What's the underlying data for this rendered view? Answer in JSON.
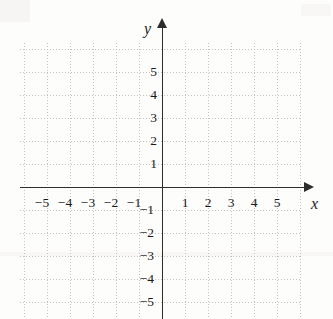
{
  "figure": {
    "kind": "cartesian-coordinate-grid",
    "background_color": "#fdfdfc",
    "axis_color": "#2d2d2d",
    "grid_color": "#c2c2c2",
    "label_color": "#1a1a1a"
  },
  "axes": {
    "x_name": "x",
    "y_name": "y",
    "x_arrow": "arrow-right-icon",
    "y_arrow": "arrow-up-icon"
  },
  "chart_data": {
    "type": "scatter",
    "title": "",
    "subtitle": "",
    "xlabel": "x",
    "ylabel": "y",
    "xlim": [
      -6,
      6
    ],
    "ylim": [
      -6,
      6
    ],
    "xticks": [
      -5,
      -4,
      -3,
      -2,
      -1,
      1,
      2,
      3,
      4,
      5
    ],
    "yticks": [
      5,
      4,
      3,
      2,
      1,
      -1,
      -2,
      -3,
      -4,
      -5
    ],
    "xtick_labels": [
      "−5",
      "−4",
      "−3",
      "−2",
      "−1",
      "1",
      "2",
      "3",
      "4",
      "5"
    ],
    "ytick_labels": [
      "5",
      "4",
      "3",
      "2",
      "1",
      "−1",
      "−2",
      "−3",
      "−4",
      "−5"
    ],
    "grid": true,
    "grid_style": "dotted",
    "grid_spacing_units": 1,
    "legend": null,
    "legend_position": "none",
    "annotations": [],
    "series": [],
    "x": [],
    "values": []
  },
  "geometry": {
    "origin_x": 162,
    "origin_y": 187,
    "unit_px": 23,
    "grid_left": 20,
    "grid_top": 43,
    "grid_right": 301,
    "grid_bottom": 319
  },
  "labels": {
    "x_ticks": [
      {
        "text": "−5",
        "left": 30,
        "top": 196
      },
      {
        "text": "−4",
        "left": 53,
        "top": 196
      },
      {
        "text": "−3",
        "left": 76,
        "top": 196
      },
      {
        "text": "−2",
        "left": 99,
        "top": 196
      },
      {
        "text": "−1",
        "left": 122,
        "top": 196
      },
      {
        "text": "1",
        "left": 173,
        "top": 196
      },
      {
        "text": "2",
        "left": 196,
        "top": 196
      },
      {
        "text": "3",
        "left": 219,
        "top": 196
      },
      {
        "text": "4",
        "left": 242,
        "top": 196
      },
      {
        "text": "5",
        "left": 265,
        "top": 196
      }
    ],
    "y_ticks": [
      {
        "text": "5",
        "left": 131,
        "top": 65
      },
      {
        "text": "4",
        "left": 131,
        "top": 88
      },
      {
        "text": "3",
        "left": 131,
        "top": 111
      },
      {
        "text": "2",
        "left": 131,
        "top": 134
      },
      {
        "text": "1",
        "left": 131,
        "top": 157
      },
      {
        "text": "−1",
        "left": 128,
        "top": 203
      },
      {
        "text": "−2",
        "left": 128,
        "top": 226
      },
      {
        "text": "−3",
        "left": 128,
        "top": 249
      },
      {
        "text": "−4",
        "left": 128,
        "top": 272
      },
      {
        "text": "−5",
        "left": 128,
        "top": 295
      }
    ],
    "x_name_pos": {
      "left": 311,
      "top": 196
    },
    "y_name_pos": {
      "left": 144,
      "top": 21
    }
  }
}
